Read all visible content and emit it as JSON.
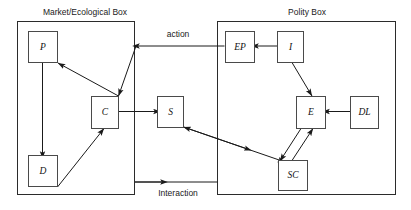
{
  "diagram": {
    "background_color": "#ffffff",
    "line_color": "#1a1a1a",
    "box_stroke_color": "#4a4a4a",
    "groups": [
      {
        "id": "market",
        "title": "Market/Ecological Box"
      },
      {
        "id": "polity",
        "title": "Polity Box"
      }
    ],
    "nodes": [
      {
        "id": "P",
        "label": "P",
        "group": "market"
      },
      {
        "id": "C",
        "label": "C",
        "group": "market"
      },
      {
        "id": "D",
        "label": "D",
        "group": "market"
      },
      {
        "id": "S",
        "label": "S",
        "group": "between"
      },
      {
        "id": "EP",
        "label": "EP",
        "group": "polity"
      },
      {
        "id": "I",
        "label": "I",
        "group": "polity"
      },
      {
        "id": "E",
        "label": "E",
        "group": "polity"
      },
      {
        "id": "DL",
        "label": "DL",
        "group": "polity"
      },
      {
        "id": "SC",
        "label": "SC",
        "group": "polity"
      }
    ],
    "edge_labels": [
      {
        "id": "action",
        "label": "action"
      },
      {
        "id": "interaction",
        "label": "Interaction"
      }
    ],
    "edges": [
      {
        "from": "P",
        "to": "D",
        "arrow": "single"
      },
      {
        "from": "P",
        "to": "C",
        "arrow": "reverse"
      },
      {
        "from": "C",
        "to": "S",
        "arrow": "single"
      },
      {
        "from": "D",
        "to": "C",
        "arrow": "single"
      },
      {
        "from": "EP",
        "to": "market",
        "arrow": "single",
        "label": "action"
      },
      {
        "from": "I",
        "to": "EP",
        "arrow": "single"
      },
      {
        "from": "E",
        "to": "I",
        "arrow": "single"
      },
      {
        "from": "DL",
        "to": "E",
        "arrow": "single"
      },
      {
        "from": "E",
        "to": "SC",
        "arrow": "single"
      },
      {
        "from": "SC",
        "to": "E",
        "arrow": "single"
      },
      {
        "from": "S",
        "to": "SC",
        "arrow": "double"
      },
      {
        "from": "market",
        "to": "polity",
        "arrow": "single",
        "label": "Interaction"
      }
    ]
  }
}
